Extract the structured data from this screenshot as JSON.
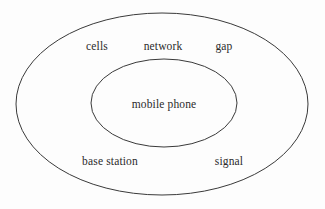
{
  "diagram": {
    "type": "nested-ellipse-venn",
    "background_color": "#fdfdfd",
    "stroke_color": "#3a3a3a",
    "text_color": "#2b2b2b",
    "outer_ellipse": {
      "name": "outer-region",
      "cx": 162,
      "cy": 104,
      "rx": 146,
      "ry": 91
    },
    "inner_ellipse": {
      "name": "inner-region",
      "cx": 164,
      "cy": 103,
      "rx": 73,
      "ry": 44
    },
    "inner_labels": [
      {
        "text": "mobile phone",
        "x": 164,
        "y": 104
      }
    ],
    "outer_labels": [
      {
        "text": "cells",
        "x": 97,
        "y": 46
      },
      {
        "text": "network",
        "x": 163,
        "y": 46
      },
      {
        "text": "gap",
        "x": 224,
        "y": 46
      },
      {
        "text": "base station",
        "x": 110,
        "y": 161
      },
      {
        "text": "signal",
        "x": 229,
        "y": 161
      }
    ]
  }
}
